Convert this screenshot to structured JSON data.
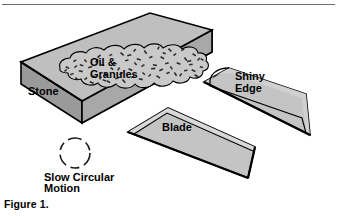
{
  "figure": {
    "caption": "Figure 1.",
    "top_rule": true,
    "background_color": "#ffffff",
    "outline_color": "#000000"
  },
  "labels": {
    "stone": "Stone",
    "oil_line1": "Oil &",
    "oil_line2": "Granules",
    "blade": "Blade",
    "shiny_line1": "Shiny",
    "shiny_line2": "Edge",
    "motion_line1": "Slow Circular",
    "motion_line2": "Motion"
  },
  "objects": {
    "stone_block": {
      "name": "sharpening-stone",
      "top_face_color": "#bfbfbf",
      "front_face_color": "#a8a8a8",
      "end_face_color": "#9a9a9a"
    },
    "oil_puddle": {
      "name": "oil-and-granules-puddle",
      "fill_color": "#c9c9c9",
      "granule_color": "#2b2b2b",
      "granule_count": 96
    },
    "blade_lower": {
      "name": "blade",
      "face_color": "#c4c4c4",
      "bevel_color": "#d8d8d8"
    },
    "blade_upper": {
      "name": "shiny-edge-blade",
      "face_color": "#c4c4c4",
      "bevel_color": "#d8d8d8"
    },
    "motion_circle": {
      "name": "slow-circular-motion-indicator",
      "style": "dashed-circle",
      "stroke_color": "#1a1a1a",
      "center_x": 75,
      "center_y": 153,
      "radius": 15
    }
  }
}
